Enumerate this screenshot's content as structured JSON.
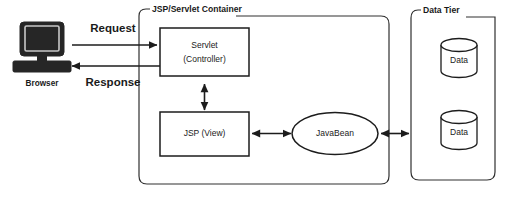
{
  "diagram": {
    "background_color": "#ffffff",
    "line_color": "#1c1c1c",
    "containers": [
      {
        "id": "servlet_container",
        "label": "JSP/Servlet Container"
      },
      {
        "id": "data_tier",
        "label": "Data Tier"
      }
    ],
    "client": {
      "device_label": "Browser",
      "icon": "desktop-computer-icon",
      "icon_color": "#262626"
    },
    "nodes": [
      {
        "id": "servlet",
        "shape": "rectangle",
        "line1": "Servlet",
        "line2": "(Controller)"
      },
      {
        "id": "jsp",
        "shape": "rectangle",
        "line1": "JSP (View)",
        "line2": ""
      },
      {
        "id": "javabean",
        "shape": "ellipse",
        "line1": "JavaBean",
        "line2": ""
      },
      {
        "id": "data_top",
        "shape": "cylinder",
        "line1": "Data",
        "line2": ""
      },
      {
        "id": "data_bottom",
        "shape": "cylinder",
        "line1": "Data",
        "line2": ""
      }
    ],
    "flows": [
      {
        "id": "request",
        "label": "Request",
        "from": "browser",
        "to": "servlet",
        "direction": "one-way"
      },
      {
        "id": "response",
        "label": "Response",
        "from": "servlet",
        "to": "browser",
        "direction": "one-way"
      },
      {
        "id": "servlet_jsp",
        "label": "",
        "from": "servlet",
        "to": "jsp",
        "direction": "two-way"
      },
      {
        "id": "jsp_bean",
        "label": "",
        "from": "jsp",
        "to": "javabean",
        "direction": "two-way"
      },
      {
        "id": "bean_data",
        "label": "",
        "from": "javabean",
        "to": "data_tier",
        "direction": "two-way"
      }
    ]
  }
}
